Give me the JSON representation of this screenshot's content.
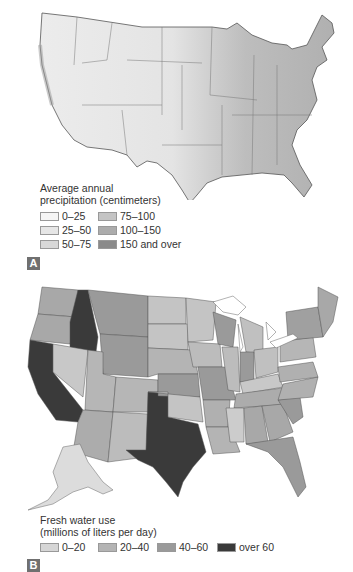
{
  "panel_a": {
    "badge": "A",
    "legend": {
      "title_line1": "Average annual",
      "title_line2": "precipitation (centimeters)",
      "items": [
        {
          "label": "0–25",
          "color": "#f6f6f6"
        },
        {
          "label": "25–50",
          "color": "#e6e6e6"
        },
        {
          "label": "50–75",
          "color": "#d8d8d8"
        },
        {
          "label": "75–100",
          "color": "#c4c4c4"
        },
        {
          "label": "100–150",
          "color": "#acacac"
        },
        {
          "label": "150 and over",
          "color": "#8a8a8a"
        }
      ]
    }
  },
  "panel_b": {
    "badge": "B",
    "legend": {
      "title_line1": "Fresh water use",
      "title_line2": "(millions of liters per day)",
      "items": [
        {
          "label": "0–20",
          "color": "#d6d6d6"
        },
        {
          "label": "20–40",
          "color": "#b4b4b4"
        },
        {
          "label": "40–60",
          "color": "#9a9a9a"
        },
        {
          "label": "over 60",
          "color": "#3a3a3a"
        }
      ]
    }
  }
}
